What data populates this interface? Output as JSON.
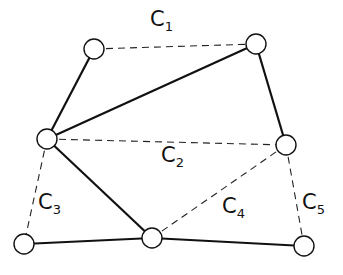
{
  "diagram": {
    "nodes": [
      {
        "id": "n1",
        "x": 94,
        "y": 49
      },
      {
        "id": "n2",
        "x": 256,
        "y": 44
      },
      {
        "id": "n3",
        "x": 47,
        "y": 139
      },
      {
        "id": "n4",
        "x": 286,
        "y": 145
      },
      {
        "id": "n5",
        "x": 24,
        "y": 244
      },
      {
        "id": "n6",
        "x": 152,
        "y": 238
      },
      {
        "id": "n7",
        "x": 304,
        "y": 246
      }
    ],
    "solid_edges": [
      [
        "n1",
        "n3"
      ],
      [
        "n3",
        "n2"
      ],
      [
        "n2",
        "n4"
      ],
      [
        "n3",
        "n6"
      ],
      [
        "n5",
        "n6"
      ],
      [
        "n6",
        "n7"
      ]
    ],
    "dashed_edges": [
      {
        "from": "n1",
        "to": "n2",
        "label": "C1"
      },
      {
        "from": "n3",
        "to": "n4",
        "label": "C2"
      },
      {
        "from": "n3",
        "to": "n5",
        "label": "C3"
      },
      {
        "from": "n6",
        "to": "n4",
        "label": "C4"
      },
      {
        "from": "n4",
        "to": "n7",
        "label": "C5"
      }
    ],
    "labels": [
      {
        "letter": "C",
        "sub": "1",
        "x": 150,
        "y": 9
      },
      {
        "letter": "C",
        "sub": "2",
        "x": 161,
        "y": 145
      },
      {
        "letter": "C",
        "sub": "3",
        "x": 38,
        "y": 192
      },
      {
        "letter": "C",
        "sub": "4",
        "x": 222,
        "y": 196
      },
      {
        "letter": "C",
        "sub": "5",
        "x": 302,
        "y": 192
      }
    ]
  }
}
